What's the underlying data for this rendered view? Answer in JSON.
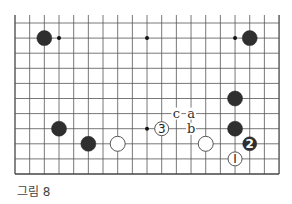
{
  "figure": {
    "caption": "그림 8",
    "grid": {
      "x0": 15,
      "dx": 14.67,
      "cols": 19,
      "y0": 23,
      "dy": 15.1,
      "rows": 11,
      "top_open_y": 15,
      "line_color": "#555555",
      "edge_color": "#444444"
    },
    "stones": [
      {
        "color": "black",
        "col": 2,
        "row": 1
      },
      {
        "color": "black",
        "col": 16,
        "row": 1
      },
      {
        "color": "black",
        "col": 15,
        "row": 5
      },
      {
        "color": "black",
        "col": 3,
        "row": 7
      },
      {
        "color": "black",
        "col": 15,
        "row": 7
      },
      {
        "color": "black",
        "col": 5,
        "row": 8
      },
      {
        "color": "white",
        "col": 7,
        "row": 8
      },
      {
        "color": "white",
        "col": 13,
        "row": 8
      },
      {
        "color": "white",
        "col": 10,
        "row": 7,
        "label": "3"
      },
      {
        "color": "black",
        "col": 16,
        "row": 8,
        "label": "2"
      },
      {
        "color": "white",
        "col": 15,
        "row": 9,
        "label": "1"
      }
    ],
    "dots": [
      {
        "col": 3,
        "row": 1
      },
      {
        "col": 9,
        "row": 1
      },
      {
        "col": 15,
        "row": 1
      },
      {
        "col": 9,
        "row": 7
      }
    ],
    "letters": [
      {
        "text": "c",
        "col": 11,
        "row": 6
      },
      {
        "text": "a",
        "col": 12,
        "row": 6
      },
      {
        "text": "b",
        "col": 12,
        "row": 7
      }
    ]
  }
}
